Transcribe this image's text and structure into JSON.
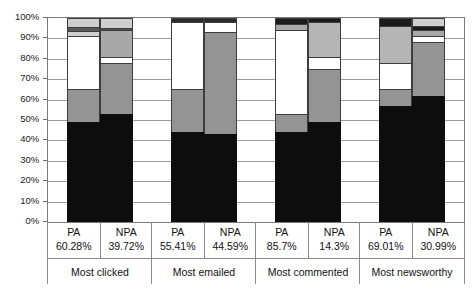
{
  "chart_data": {
    "type": "bar",
    "subtype": "stacked-bar-100-percent",
    "title": "",
    "xlabel": "",
    "ylabel": "",
    "ylim": [
      0,
      100
    ],
    "y_tick_labels": [
      "0%",
      "10%",
      "20%",
      "30%",
      "40%",
      "50%",
      "60%",
      "70%",
      "80%",
      "90%",
      "100%"
    ],
    "y_tick_values": [
      0,
      10,
      20,
      30,
      40,
      50,
      60,
      70,
      80,
      90,
      100
    ],
    "grid": true,
    "legend": "none",
    "groups": [
      {
        "label": "Most clicked",
        "bars": [
          {
            "name": "PA",
            "percent": "60.28%"
          },
          {
            "name": "NPA",
            "percent": "39.72%"
          }
        ]
      },
      {
        "label": "Most emailed",
        "bars": [
          {
            "name": "PA",
            "percent": "55.41%"
          },
          {
            "name": "NPA",
            "percent": "44.59%"
          }
        ]
      },
      {
        "label": "Most commented",
        "bars": [
          {
            "name": "PA",
            "percent": "85.7%"
          },
          {
            "name": "NPA",
            "percent": "14.3%"
          }
        ]
      },
      {
        "label": "Most newsworthy",
        "bars": [
          {
            "name": "PA",
            "percent": "69.01%"
          },
          {
            "name": "NPA",
            "percent": "30.99%"
          }
        ]
      }
    ],
    "categories": [
      "Most clicked PA",
      "Most clicked NPA",
      "Most emailed PA",
      "Most emailed NPA",
      "Most commented PA",
      "Most commented NPA",
      "Most newsworthy PA",
      "Most newsworthy NPA"
    ],
    "colors": {
      "black": "#0d0d0d",
      "mid_gray": "#949494",
      "white": "#ffffff",
      "dark_gray": "#595959",
      "light_gray": "#cfcfcf"
    },
    "series": [
      {
        "name": "segment-1-black",
        "color": "#0d0d0d",
        "values": [
          49.0,
          53.0,
          44.0,
          43.0,
          44.0,
          49.0,
          57.0,
          62.0
        ]
      },
      {
        "name": "segment-2-mid-gray",
        "color": "#949494",
        "values": [
          16.0,
          25.0,
          21.0,
          50.0,
          9.0,
          26.0,
          8.0,
          26.0
        ]
      },
      {
        "name": "segment-3-white",
        "color": "#ffffff",
        "values": [
          26.0,
          3.0,
          34.0,
          5.0,
          41.0,
          6.0,
          13.0,
          3.0
        ]
      },
      {
        "name": "segment-4-light-gray",
        "color": "#cfcfcf",
        "values": [
          4.0,
          13.0,
          0.0,
          0.0,
          3.0,
          17.0,
          19.0,
          3.0
        ]
      },
      {
        "name": "segment-5-dark-gray",
        "color": "#595959",
        "values": [
          0.0,
          0.0,
          1.0,
          2.0,
          3.0,
          2.0,
          3.0,
          3.0
        ]
      },
      {
        "name": "segment-6-light-gray",
        "color": "#cfcfcf",
        "values": [
          5.0,
          6.0,
          0.0,
          0.0,
          0.0,
          0.0,
          0.0,
          3.0
        ]
      }
    ],
    "stacks": [
      {
        "bar": "Most clicked PA",
        "segments": [
          {
            "color": "#0d0d0d",
            "from": 0,
            "to": 49
          },
          {
            "color": "#949494",
            "from": 49,
            "to": 65
          },
          {
            "color": "#ffffff",
            "from": 65,
            "to": 91
          },
          {
            "color": "#cfcfcf",
            "from": 91,
            "to": 93.5
          },
          {
            "color": "#595959",
            "from": 93.5,
            "to": 95.5
          },
          {
            "color": "#cfcfcf",
            "from": 95.5,
            "to": 100
          }
        ]
      },
      {
        "bar": "Most clicked NPA",
        "segments": [
          {
            "color": "#0d0d0d",
            "from": 0,
            "to": 53
          },
          {
            "color": "#949494",
            "from": 53,
            "to": 78
          },
          {
            "color": "#ffffff",
            "from": 78,
            "to": 81
          },
          {
            "color": "#a8a8a8",
            "from": 81,
            "to": 94
          },
          {
            "color": "#4d4d4d",
            "from": 94,
            "to": 95
          },
          {
            "color": "#cfcfcf",
            "from": 95,
            "to": 100
          }
        ]
      },
      {
        "bar": "Most emailed PA",
        "segments": [
          {
            "color": "#0d0d0d",
            "from": 0,
            "to": 44
          },
          {
            "color": "#949494",
            "from": 44,
            "to": 65
          },
          {
            "color": "#ffffff",
            "from": 65,
            "to": 98
          },
          {
            "color": "#2b2b2b",
            "from": 98,
            "to": 100
          }
        ]
      },
      {
        "bar": "Most emailed NPA",
        "segments": [
          {
            "color": "#0d0d0d",
            "from": 0,
            "to": 43
          },
          {
            "color": "#949494",
            "from": 43,
            "to": 93
          },
          {
            "color": "#ffffff",
            "from": 93,
            "to": 98
          },
          {
            "color": "#2b2b2b",
            "from": 98,
            "to": 100
          }
        ]
      },
      {
        "bar": "Most commented PA",
        "segments": [
          {
            "color": "#0d0d0d",
            "from": 0,
            "to": 44
          },
          {
            "color": "#949494",
            "from": 44,
            "to": 53
          },
          {
            "color": "#ffffff",
            "from": 53,
            "to": 94
          },
          {
            "color": "#a8a8a8",
            "from": 94,
            "to": 97
          },
          {
            "color": "#1a1a1a",
            "from": 97,
            "to": 100
          }
        ]
      },
      {
        "bar": "Most commented NPA",
        "segments": [
          {
            "color": "#0d0d0d",
            "from": 0,
            "to": 49
          },
          {
            "color": "#949494",
            "from": 49,
            "to": 75
          },
          {
            "color": "#ffffff",
            "from": 75,
            "to": 81
          },
          {
            "color": "#b5b5b5",
            "from": 81,
            "to": 98
          },
          {
            "color": "#1a1a1a",
            "from": 98,
            "to": 100
          }
        ]
      },
      {
        "bar": "Most newsworthy PA",
        "segments": [
          {
            "color": "#0d0d0d",
            "from": 0,
            "to": 57
          },
          {
            "color": "#949494",
            "from": 57,
            "to": 65
          },
          {
            "color": "#ffffff",
            "from": 65,
            "to": 78
          },
          {
            "color": "#b5b5b5",
            "from": 78,
            "to": 96
          },
          {
            "color": "#1a1a1a",
            "from": 96,
            "to": 100
          }
        ]
      },
      {
        "bar": "Most newsworthy NPA",
        "segments": [
          {
            "color": "#0d0d0d",
            "from": 0,
            "to": 62
          },
          {
            "color": "#949494",
            "from": 62,
            "to": 88
          },
          {
            "color": "#ffffff",
            "from": 88,
            "to": 91
          },
          {
            "color": "#a8a8a8",
            "from": 91,
            "to": 94
          },
          {
            "color": "#1a1a1a",
            "from": 94,
            "to": 96
          },
          {
            "color": "#cfcfcf",
            "from": 96,
            "to": 100
          }
        ]
      }
    ]
  }
}
